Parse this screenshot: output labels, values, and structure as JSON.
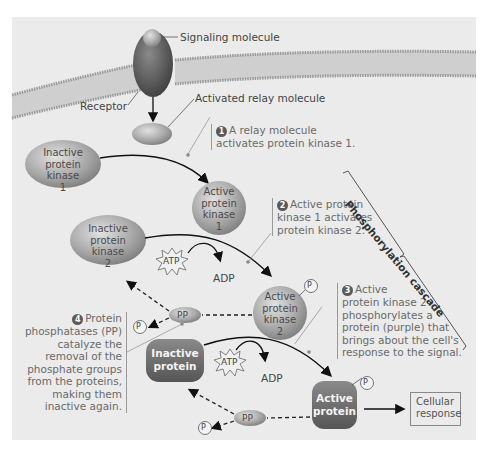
{
  "labels": {
    "signaling_molecule": "Signaling molecule",
    "receptor": "Receptor",
    "activated_relay": "Activated relay molecule",
    "cellular_response_line1": "Cellular",
    "cellular_response_line2": "response",
    "phosphorylation_cascade": "Phosphorylation cascade"
  },
  "molecules": {
    "inactive_pk1": [
      "Inactive",
      "protein kinase",
      "1"
    ],
    "active_pk1": [
      "Active",
      "protein",
      "kinase",
      "1"
    ],
    "inactive_pk2": [
      "Inactive",
      "protein kinase",
      "2"
    ],
    "active_pk2": [
      "Active",
      "protein",
      "kinase",
      "2"
    ],
    "inactive_protein": [
      "Inactive",
      "protein"
    ],
    "active_protein": [
      "Active",
      "protein"
    ],
    "atp": "ATP",
    "adp": "ADP",
    "pp": "PP",
    "p": "P",
    "pi_sub": "i"
  },
  "steps": [
    {
      "num": "1",
      "lines": [
        "A relay molecule",
        "activates protein kinase 1."
      ]
    },
    {
      "num": "2",
      "lines": [
        "Active protein",
        "kinase 1 activates",
        "protein kinase 2."
      ]
    },
    {
      "num": "3",
      "lines": [
        "Active",
        "protein kinase 2",
        "phosphorylates a",
        "protein (purple) that",
        "brings about the cell's",
        "response to the signal."
      ]
    },
    {
      "num": "4",
      "lines": [
        "Protein",
        "phosphatases (PP)",
        "catalyze the",
        "removal of the",
        "phosphate groups",
        "from the proteins,",
        "making them",
        "inactive again."
      ]
    }
  ],
  "colors": {
    "panel_bg": "#ebebeb",
    "membrane": "#c8c8c8",
    "kinase_fill": "#a8a8a8",
    "protein_fill": "#6e6e6e",
    "receptor_fill": "#5e5e5e"
  }
}
